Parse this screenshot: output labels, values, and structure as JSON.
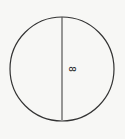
{
  "diagram": {
    "shape": "circle",
    "line": "diameter",
    "diameter_label": "8",
    "colors": {
      "background": "#f7f7f5",
      "stroke": "#333333",
      "diameter": "#555555"
    }
  }
}
